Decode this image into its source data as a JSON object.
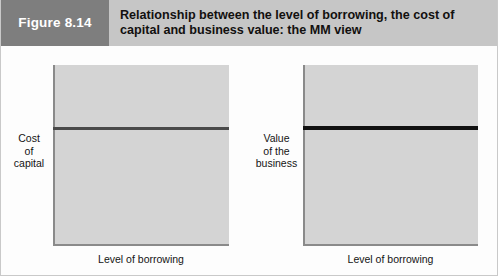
{
  "figure": {
    "tag": "Figure 8.14",
    "title": "Relationship between the level of borrowing, the cost of capital and business value: the MM view",
    "tag_background": "#7e7e7e",
    "header_background": "#c6c6c6",
    "plot_background": "#d4d4d4"
  },
  "charts": [
    {
      "id": "cost-of-capital",
      "y_axis_label_lines": [
        "Cost",
        "of",
        "capital"
      ],
      "x_axis_label": "Level of borrowing",
      "line_color": "#4a4a4a"
    },
    {
      "id": "business-value",
      "y_axis_label_lines": [
        "Value",
        "of the",
        "business"
      ],
      "x_axis_label": "Level of borrowing",
      "line_color": "#111111"
    }
  ],
  "chart_data": [
    {
      "type": "line",
      "title": "Cost of capital vs level of borrowing (MM view)",
      "xlabel": "Level of borrowing",
      "ylabel": "Cost of capital",
      "x": [
        0,
        1
      ],
      "series": [
        {
          "name": "Cost of capital",
          "values": [
            0.66,
            0.66
          ],
          "color": "#4a4a4a"
        }
      ],
      "xlim": [
        0,
        1
      ],
      "ylim": [
        0,
        1
      ],
      "grid": false,
      "legend": "none",
      "ticks": {
        "x": [],
        "y": []
      },
      "annotation": "Constant horizontal line: cost of capital is independent of gearing"
    },
    {
      "type": "line",
      "title": "Business value vs level of borrowing (MM view)",
      "xlabel": "Level of borrowing",
      "ylabel": "Value of the business",
      "x": [
        0,
        1
      ],
      "series": [
        {
          "name": "Value of the business",
          "values": [
            0.665,
            0.665
          ],
          "color": "#111111"
        }
      ],
      "xlim": [
        0,
        1
      ],
      "ylim": [
        0,
        1
      ],
      "grid": false,
      "legend": "none",
      "ticks": {
        "x": [],
        "y": []
      },
      "annotation": "Constant horizontal line: business value is independent of gearing"
    }
  ]
}
